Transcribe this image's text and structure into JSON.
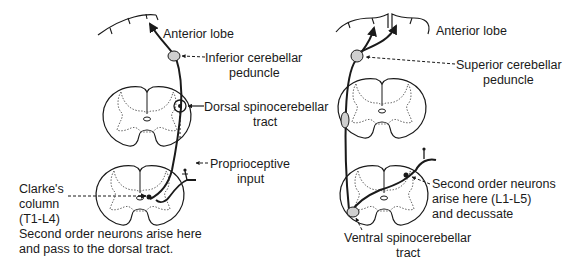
{
  "left_panel": {
    "title": "Dorsal spinocerebellar pathway",
    "labels": {
      "anterior_lobe": "Anterior lobe",
      "inferior_peduncle_1": "Inferior cerebellar",
      "inferior_peduncle_2": "peduncle",
      "dorsal_tract_1": "Dorsal spinocerebellar",
      "dorsal_tract_2": "tract",
      "proprioceptive_1": "Proprioceptive",
      "proprioceptive_2": "input",
      "clarke_1": "Clarke's",
      "clarke_2": "column",
      "clarke_3": "(T1-L4)",
      "note_1": "Second order neurons arise here",
      "note_2": "and pass to the dorsal tract."
    }
  },
  "right_panel": {
    "title": "Ventral spinocerebellar pathway",
    "labels": {
      "anterior_lobe": "Anterior lobe",
      "superior_peduncle_1": "Superior cerebellar",
      "superior_peduncle_2": "peduncle",
      "second_order_1": "Second order neurons",
      "second_order_2": "arise here (L1-L5)",
      "second_order_3": "and decussate",
      "ventral_tract_1": "Ventral spinocerebellar",
      "ventral_tract_2": "tract"
    }
  },
  "colors": {
    "ink": "#1a1a1a",
    "grey_matter_outline": "#555555",
    "background": "#ffffff"
  }
}
